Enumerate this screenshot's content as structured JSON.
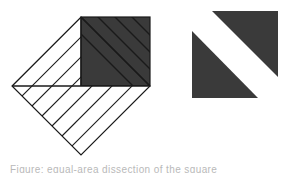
{
  "figure": {
    "background_color": "#ffffff",
    "width": 287,
    "height": 173,
    "stroke_color": "#1a1a1a",
    "fill_dark": "#3a3a3a",
    "fill_light": "#ffffff",
    "stroke_width": 1.1
  },
  "left_figure": {
    "name": "hatched-diamond-with-dark-square",
    "description": "A square rotated 45 degrees (diamond) whose upper-right quadrant is filled dark; remaining regions are hatched with parallel diagonal lines.",
    "center": {
      "x": 81,
      "y": 86
    },
    "half_diagonal": 69,
    "vertices": {
      "top": {
        "x": 81,
        "y": 17
      },
      "right": {
        "x": 150,
        "y": 86
      },
      "bottom": {
        "x": 81,
        "y": 155
      },
      "left": {
        "x": 12,
        "y": 86
      }
    },
    "dark_square": {
      "x": 81,
      "y": 17,
      "width": 69,
      "height": 69,
      "color": "#3a3a3a",
      "hatch_direction": "backslash",
      "hatch_count": 4,
      "hatch_spacing": 17
    },
    "upper_left_quadrant": {
      "hatch_direction": "slash",
      "hatch_count": 7,
      "hatch_spacing": 9.8,
      "fill": "#ffffff"
    },
    "lower_half": {
      "hatch_direction": "slash",
      "hatch_count": 13,
      "hatch_spacing": 9.8,
      "fill": "#ffffff"
    }
  },
  "right_figure": {
    "name": "two-triangles-with-white-diagonal-band",
    "description": "Two congruent dark right triangles offset along a diagonal, separated by a white band.",
    "color": "#3a3a3a",
    "upper_triangle": {
      "points": "212,11 278,11 278,77"
    },
    "lower_triangle": {
      "points": "192,31 192,98 258,98"
    },
    "bounds": {
      "x": 192,
      "y": 11,
      "width": 86,
      "height": 87
    }
  },
  "caption": {
    "text": "Figure: equal-area dissection of the square",
    "visible": "partial",
    "color": "#b9b9b9"
  }
}
